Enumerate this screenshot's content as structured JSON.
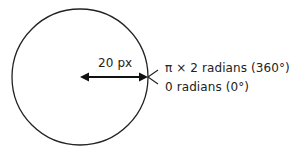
{
  "diagram": {
    "type": "circle-radius-angle",
    "circle": {
      "cx": 80,
      "cy": 77,
      "r": 68,
      "stroke": "#222222"
    },
    "radius_label": "20 px",
    "angle_labels": {
      "end": "π × 2 radians (360°)",
      "start": "0 radians (0°)"
    }
  }
}
